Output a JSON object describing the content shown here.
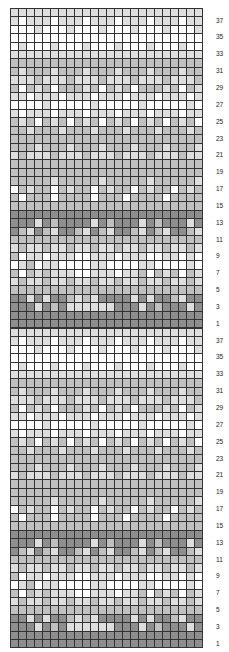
{
  "chart_data": {
    "type": "heatmap",
    "title": "",
    "columns": 24,
    "rows_per_repeat": 38,
    "repeats": 2,
    "row_labels": [
      37,
      35,
      33,
      31,
      29,
      27,
      25,
      23,
      21,
      19,
      17,
      15,
      13,
      11,
      9,
      7,
      5,
      3,
      1
    ],
    "colors": {
      "W": "#ffffff",
      "L": "#dedede",
      "M": "#c0c0c0",
      "D": "#8e8e8e"
    },
    "legend": {
      "W": "white",
      "L": "light gray",
      "M": "mid gray",
      "D": "dark gray"
    },
    "pattern_top_to_bottom": [
      "LLLLLLLLLLLLLLLLLLLLLLLL",
      "LWLLLWLLLWLLLWLLLWLLLWLL",
      "WWWLWWWLWWWLWWWLWWWLWWWL",
      "WWWWWWWWWWWWWWWWWWWWWWWW",
      "WLWWWLWWWLWWWLWWWLWWWLWW",
      "LLLLLLLLLLLLLLLLLLLLLLLL",
      "MMMMMMMMMMMMMMMMMMMMMMMM",
      "MLMMMLMMMLMMMLMMMLMMMLMM",
      "LLLMLLLMLLLMLLLMLLLMLLLM",
      "MWMLMWMMMLMWMLMWMMMLMWML",
      "LLWLLLWLLLWLLLWLLLWLLLWL",
      "WWWWLWWWWWLWWWWWLWWWWWLW",
      "LWLLLWLLLWLLLWLLLWLLLWLL",
      "MLMWMLMWMLMWMLMWMLMWMLMW",
      "MMLMMMLMMMLMMMLMMMLMMMLM",
      "MMMMMMMMMMMMMMMMMMMMMMMM",
      "MMMLMMMLMMMLMMMLMMMLMMML",
      "LMLLLMLLLMLLLMLLLMLLLMLL",
      "MMMMMMMMMMMMMMMMMMMMMMMM",
      "MMMMMMMMMMMMMMMMMMMMMMMM",
      "MMMMMLMMMMMLMMMMMLMMMMML",
      "WMLMMWMLMMWMLMMWMLMMWMLM",
      "MWMMMWMMMMWMMMWMMMMWMMMM",
      "MMMMMMMMMMMMMMMMMMMMMMMM",
      "DDDDDDDDDDDDDDDDDDDDDDDD",
      "DDDLDMDDDDLDMDDDLDMDDDLD",
      "DMLDMLDDMLDMLDDMLDMLDDML",
      "MMMMMMMMMMMMMMMMMMMMMMMM",
      "LMLLMLLMLLMLLMLLMLLMLLML",
      "MWLLWLLLWWLLLWLLLWWLLWLW",
      "WLMWLLWWWWLLWWWWLLWWWWLW",
      "MWMLMLLLWWLLLWLLMWMLMWML",
      "LMLLMLLMLLMLLMLLMLLMLLML",
      "MMMMMMMMMMMMMMMMMMMMMMMM",
      "DDLDLDDMLMLDDDDLDLDDMLDD",
      "DDDLDMDLLLLLLDDDLDMDDDLD",
      "DDDDDDDDDDDDDDDDDDDDDDDD",
      "DDDDDDDDDDDDDDDDDDDDDDDD"
    ]
  }
}
